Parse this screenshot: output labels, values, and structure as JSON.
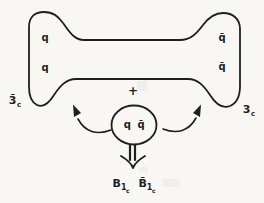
{
  "figure": {
    "background": "#f8f7f4",
    "line_color": "#1f1f1f",
    "flux_tube": {
      "quark_top_left": "q",
      "quark_bottom_left": "q",
      "antiquark_top_right": "q̄",
      "antiquark_bottom_right": "q̄",
      "left_color_state": {
        "main": "3̄",
        "sub": "c"
      },
      "right_color_state": {
        "main": "3",
        "sub": "c"
      }
    },
    "pair_creation": {
      "plus_sign": "+",
      "pair_label": "q q̄"
    },
    "decay_products": {
      "baryon": {
        "main": "B",
        "sub": "1",
        "subsub": "c"
      },
      "antibaryon": {
        "main": "B̄",
        "sub": "1",
        "subsub": "c"
      }
    }
  }
}
